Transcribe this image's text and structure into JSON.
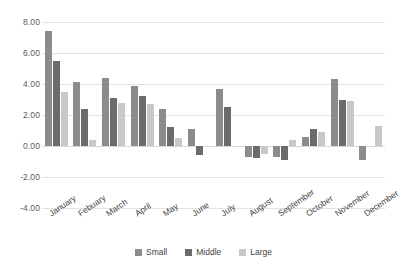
{
  "chart_data": {
    "type": "bar",
    "title": "",
    "xlabel": "",
    "ylabel": "",
    "ylim": [
      -4.0,
      8.0
    ],
    "ytick_step": 2.0,
    "grid": true,
    "legend_position": "bottom",
    "categories": [
      "January",
      "Febuary",
      "March",
      "April",
      "May",
      "June",
      "July",
      "August",
      "September",
      "October",
      "November",
      "December"
    ],
    "ytick_labels": [
      "8.00",
      "6.00",
      "4.00",
      "2.00",
      "0.00",
      "-2.00",
      "-4.00"
    ],
    "ytick_values": [
      8.0,
      6.0,
      4.0,
      2.0,
      0.0,
      -2.0,
      -4.0
    ],
    "series": [
      {
        "name": "Small",
        "color": "#8c8c8c",
        "values": [
          7.4,
          4.1,
          4.4,
          3.9,
          2.4,
          1.1,
          3.7,
          -0.7,
          -0.7,
          0.6,
          4.3,
          -0.9
        ]
      },
      {
        "name": "Middle",
        "color": "#6b6b6b",
        "values": [
          5.5,
          2.4,
          3.1,
          3.2,
          1.2,
          -0.6,
          2.5,
          -0.8,
          -0.9,
          1.1,
          3.0,
          0.0
        ]
      },
      {
        "name": "Large",
        "color": "#c8c8c8",
        "values": [
          3.5,
          0.4,
          2.8,
          2.7,
          0.5,
          0.0,
          0.0,
          -0.5,
          0.4,
          0.9,
          2.9,
          1.3
        ]
      }
    ]
  },
  "legend": {
    "items": [
      {
        "label": "Small"
      },
      {
        "label": "Middle"
      },
      {
        "label": "Large"
      }
    ]
  }
}
